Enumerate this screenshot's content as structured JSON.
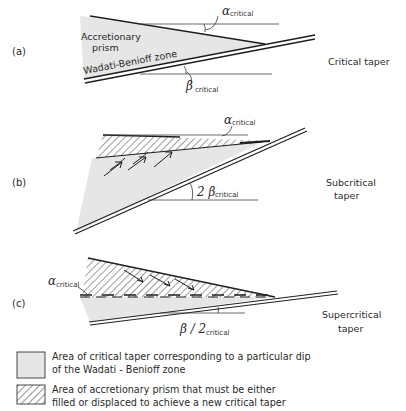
{
  "figure": {
    "panels": [
      {
        "id": "a",
        "label": "(a)",
        "title": "Critical taper",
        "prism_label_line1": "Accretionary",
        "prism_label_line2": "prism",
        "slab_label": "Wadati-Benioff zone",
        "alpha_symbol": "α",
        "alpha_sub": "critical",
        "beta_symbol": "β",
        "beta_sub": "critical"
      },
      {
        "id": "b",
        "label": "(b)",
        "title_line1": "Subcritical",
        "title_line2": "taper",
        "alpha_symbol": "α",
        "alpha_sub": "critical",
        "beta_symbol": "2 β",
        "beta_sub": "critical"
      },
      {
        "id": "c",
        "label": "(c)",
        "title_line1": "Supercritical",
        "title_line2": "taper",
        "alpha_symbol": "α",
        "alpha_sub": "critical",
        "beta_symbol": "β / 2",
        "beta_sub": "critical"
      }
    ],
    "legend": [
      {
        "pattern": "shaded",
        "line1": "Area of critical taper corresponding to a particular dip",
        "line2": "of the Wadati - Benioff zone"
      },
      {
        "pattern": "hatched",
        "line1": "Area of accretionary prism that must be either",
        "line2": "filled or displaced to achieve a new critical taper"
      }
    ],
    "colors": {
      "shade": "#e6e6e6",
      "line": "#1e1e1e",
      "hatch": "#3a3a3a"
    }
  }
}
